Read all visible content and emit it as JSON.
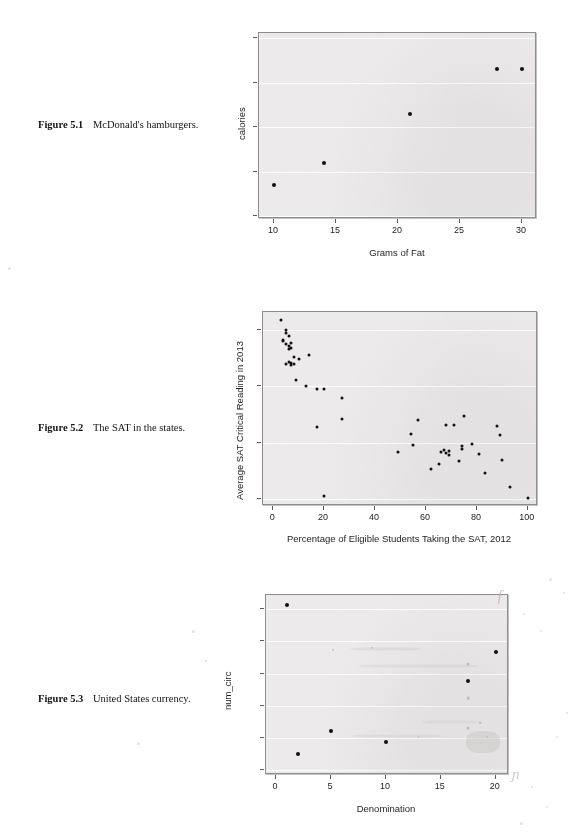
{
  "page": {
    "width": 576,
    "height": 839,
    "background": "#ffffff",
    "panel_fill": "#eceaea",
    "point_color": "#111111"
  },
  "figures": [
    {
      "id": "figure-5-1",
      "caption_label": "Figure 5.1",
      "caption_text": "McDonald's hamburgers.",
      "chart_data": {
        "type": "scatter",
        "title": "",
        "xlabel": "Grams of Fat",
        "ylabel": "calories",
        "xlim": [
          8.8,
          31.2
        ],
        "ylim": [
          193,
          612
        ],
        "xticks": [
          10,
          15,
          20,
          25,
          30
        ],
        "yticks": [
          200,
          300,
          400,
          500,
          600
        ],
        "grid": true,
        "legend": "none",
        "x": [
          10,
          14,
          21,
          28,
          30
        ],
        "y": [
          270,
          320,
          430,
          530,
          530
        ],
        "points": [
          {
            "x": 10,
            "y": 270
          },
          {
            "x": 14,
            "y": 320
          },
          {
            "x": 21,
            "y": 430
          },
          {
            "x": 28,
            "y": 530
          },
          {
            "x": 30,
            "y": 530
          }
        ]
      }
    },
    {
      "id": "figure-5-2",
      "caption_label": "Figure 5.2",
      "caption_text": "The SAT in the states.",
      "chart_data": {
        "type": "scatter",
        "title": "",
        "xlabel": "Percentage of Eligible Students Taking the SAT, 2012",
        "ylabel": "Average SAT Critical Reading in 2013",
        "xlim": [
          -4,
          104
        ],
        "ylim": [
          444,
          616
        ],
        "xticks": [
          0,
          20,
          40,
          60,
          80,
          100
        ],
        "yticks": [
          450,
          500,
          550,
          600
        ],
        "grid": true,
        "legend": "none",
        "x": [
          3,
          4,
          4,
          5,
          5,
          5,
          5,
          6,
          6,
          6,
          6,
          7,
          7,
          7,
          7,
          8,
          8,
          9,
          10,
          13,
          14,
          17,
          17,
          20,
          20,
          27,
          27,
          49,
          54,
          55,
          57,
          62,
          65,
          66,
          67,
          68,
          68,
          69,
          69,
          71,
          73,
          74,
          74,
          75,
          78,
          81,
          83,
          88,
          89,
          90,
          93,
          100
        ],
        "y": [
          609,
          591,
          590,
          600,
          597,
          588,
          570,
          595,
          586,
          583,
          572,
          589,
          584,
          571,
          569,
          576,
          570,
          556,
          574,
          550,
          578,
          548,
          514,
          453,
          548,
          540,
          521,
          492,
          508,
          498,
          520,
          477,
          481,
          492,
          494,
          491,
          516,
          493,
          489,
          516,
          484,
          495,
          497,
          524,
          499,
          490,
          473,
          515,
          507,
          485,
          461,
          451
        ],
        "points": [
          {
            "x": 3,
            "y": 609
          },
          {
            "x": 4,
            "y": 591
          },
          {
            "x": 4,
            "y": 590
          },
          {
            "x": 5,
            "y": 600
          },
          {
            "x": 5,
            "y": 597
          },
          {
            "x": 5,
            "y": 588
          },
          {
            "x": 5,
            "y": 570
          },
          {
            "x": 6,
            "y": 595
          },
          {
            "x": 6,
            "y": 586
          },
          {
            "x": 6,
            "y": 583
          },
          {
            "x": 6,
            "y": 572
          },
          {
            "x": 7,
            "y": 589
          },
          {
            "x": 7,
            "y": 584
          },
          {
            "x": 7,
            "y": 571
          },
          {
            "x": 7,
            "y": 569
          },
          {
            "x": 8,
            "y": 576
          },
          {
            "x": 8,
            "y": 570
          },
          {
            "x": 9,
            "y": 556
          },
          {
            "x": 10,
            "y": 574
          },
          {
            "x": 13,
            "y": 550
          },
          {
            "x": 14,
            "y": 578
          },
          {
            "x": 17,
            "y": 548
          },
          {
            "x": 17,
            "y": 514
          },
          {
            "x": 20,
            "y": 453
          },
          {
            "x": 20,
            "y": 548
          },
          {
            "x": 27,
            "y": 540
          },
          {
            "x": 27,
            "y": 521
          },
          {
            "x": 49,
            "y": 492
          },
          {
            "x": 54,
            "y": 508
          },
          {
            "x": 55,
            "y": 498
          },
          {
            "x": 57,
            "y": 520
          },
          {
            "x": 62,
            "y": 477
          },
          {
            "x": 65,
            "y": 481
          },
          {
            "x": 66,
            "y": 492
          },
          {
            "x": 67,
            "y": 494
          },
          {
            "x": 68,
            "y": 491
          },
          {
            "x": 68,
            "y": 516
          },
          {
            "x": 69,
            "y": 493
          },
          {
            "x": 69,
            "y": 489
          },
          {
            "x": 71,
            "y": 516
          },
          {
            "x": 73,
            "y": 484
          },
          {
            "x": 74,
            "y": 495
          },
          {
            "x": 74,
            "y": 497
          },
          {
            "x": 75,
            "y": 524
          },
          {
            "x": 78,
            "y": 499
          },
          {
            "x": 81,
            "y": 490
          },
          {
            "x": 83,
            "y": 473
          },
          {
            "x": 88,
            "y": 515
          },
          {
            "x": 89,
            "y": 507
          },
          {
            "x": 90,
            "y": 485
          },
          {
            "x": 93,
            "y": 461
          },
          {
            "x": 100,
            "y": 451
          }
        ]
      }
    },
    {
      "id": "figure-5-3",
      "caption_label": "Figure 5.3",
      "caption_text": "United States currency.",
      "chart_data": {
        "type": "scatter",
        "title": "",
        "xlabel": "Denomination",
        "ylabel": "num_circ",
        "xlim": [
          -0.9,
          21.2
        ],
        "ylim": [
          -340000000.0,
          10900000000.0
        ],
        "xticks": [
          0,
          5,
          10,
          15,
          20
        ],
        "yticks": [
          0,
          2000000000,
          4000000000,
          6000000000,
          8000000000,
          10000000000
        ],
        "ytick_labels": [
          "0",
          "2.00e+09",
          "4.00e+09",
          "6.00e+09",
          "8.00e+09",
          "1.00e+10"
        ],
        "grid": true,
        "legend": "none",
        "x": [
          1,
          2,
          5,
          10,
          17.5,
          20
        ],
        "y": [
          10300000000,
          1000000000,
          2400000000,
          1750000000,
          5550000000,
          7350000000
        ],
        "points": [
          {
            "x": 1,
            "y": 10300000000
          },
          {
            "x": 2,
            "y": 1000000000
          },
          {
            "x": 5,
            "y": 2400000000
          },
          {
            "x": 10,
            "y": 1750000000
          },
          {
            "x": 17.5,
            "y": 5550000000
          },
          {
            "x": 20,
            "y": 7350000000
          }
        ]
      }
    }
  ]
}
